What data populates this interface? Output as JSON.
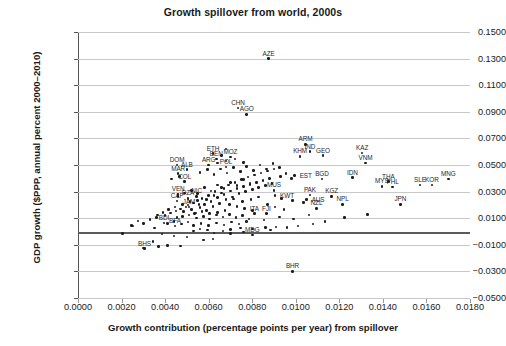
{
  "chart_data": {
    "type": "scatter",
    "title": "Growth spillover from world, 2000s",
    "xlabel": "Growth contribution (percentage points per year) from spillover",
    "ylabel": "GDP growth ($PPP, annual percent 2000–2010)",
    "xlim": [
      0.0,
      0.018
    ],
    "ylim": [
      -0.05,
      0.15
    ],
    "xticks": [
      "0.0000",
      "0.0020",
      "0.0040",
      "0.0060",
      "0.0080",
      "0.0100",
      "0.0120",
      "0.0140",
      "0.0160",
      "0.0180"
    ],
    "xtick_values": [
      0.0,
      0.002,
      0.004,
      0.006,
      0.008,
      0.01,
      0.012,
      0.014,
      0.016,
      0.018
    ],
    "yticks": [
      "0.1500",
      "0.1300",
      "0.1100",
      "0.0900",
      "0.0700",
      "0.0500",
      "0.0300",
      "0.0100",
      "−0.0100",
      "−0.0300",
      "−0.0500"
    ],
    "ytick_values": [
      0.15,
      0.13,
      0.11,
      0.09,
      0.07,
      0.05,
      0.03,
      0.01,
      -0.01,
      -0.03,
      -0.05
    ],
    "grid": "horizontal",
    "zero_line": 0.0,
    "legend": "none",
    "marker_color": "#1c1c1c",
    "grid_color": "#c9c9c9",
    "zero_line_color": "#5b5b5b",
    "points": [
      {
        "label": "AZE",
        "x": 0.00875,
        "y": 0.13,
        "lp": "above"
      },
      {
        "label": "CHN",
        "x": 0.00735,
        "y": 0.093,
        "lp": "above"
      },
      {
        "label": "AGO",
        "x": 0.00775,
        "y": 0.088,
        "lp": "above"
      },
      {
        "label": "ARM",
        "x": 0.01045,
        "y": 0.0655,
        "lp": "above"
      },
      {
        "label": "IND",
        "x": 0.01065,
        "y": 0.06,
        "lp": "above"
      },
      {
        "label": "GEO",
        "x": 0.01125,
        "y": 0.057,
        "lp": "above"
      },
      {
        "label": "KHM",
        "x": 0.0102,
        "y": 0.0565,
        "lp": "above"
      },
      {
        "label": "KAZ",
        "x": 0.01305,
        "y": 0.059,
        "lp": "above"
      },
      {
        "label": "VNM",
        "x": 0.0132,
        "y": 0.0515,
        "lp": "above"
      },
      {
        "label": "ETH",
        "x": 0.0062,
        "y": 0.0585,
        "lp": "above"
      },
      {
        "label": "MOZ",
        "x": 0.007,
        "y": 0.056,
        "lp": "above"
      },
      {
        "label": "BEN",
        "x": 0.00635,
        "y": 0.0545,
        "lp": "above"
      },
      {
        "label": "DOM",
        "x": 0.00455,
        "y": 0.05,
        "lp": "above"
      },
      {
        "label": "ALB",
        "x": 0.005,
        "y": 0.0465,
        "lp": "above"
      },
      {
        "label": "ARG",
        "x": 0.006,
        "y": 0.05,
        "lp": "above"
      },
      {
        "label": "POL",
        "x": 0.0068,
        "y": 0.0485,
        "lp": "above"
      },
      {
        "label": "EST",
        "x": 0.00995,
        "y": 0.042,
        "lp": "right"
      },
      {
        "label": "BGD",
        "x": 0.0112,
        "y": 0.0395,
        "lp": "above"
      },
      {
        "label": "IDN",
        "x": 0.0126,
        "y": 0.0405,
        "lp": "above"
      },
      {
        "label": "MAR",
        "x": 0.0046,
        "y": 0.0435,
        "lp": "above"
      },
      {
        "label": "MYS",
        "x": 0.01395,
        "y": 0.034,
        "lp": "above"
      },
      {
        "label": "THA",
        "x": 0.01425,
        "y": 0.0375,
        "lp": "above"
      },
      {
        "label": "PHL",
        "x": 0.01445,
        "y": 0.0335,
        "lp": "above"
      },
      {
        "label": "SLE",
        "x": 0.0157,
        "y": 0.035,
        "lp": "above"
      },
      {
        "label": "KOR",
        "x": 0.01625,
        "y": 0.035,
        "lp": "above"
      },
      {
        "label": "MNG",
        "x": 0.017,
        "y": 0.0395,
        "lp": "above"
      },
      {
        "label": "MUS",
        "x": 0.009,
        "y": 0.031,
        "lp": "above"
      },
      {
        "label": "COL",
        "x": 0.0049,
        "y": 0.0375,
        "lp": "above"
      },
      {
        "label": "PAK",
        "x": 0.01065,
        "y": 0.0275,
        "lp": "above"
      },
      {
        "label": "KWT",
        "x": 0.00905,
        "y": 0.027,
        "lp": "right"
      },
      {
        "label": "KGZ",
        "x": 0.01165,
        "y": 0.0265,
        "lp": "above"
      },
      {
        "label": "AUS",
        "x": 0.0105,
        "y": 0.024,
        "lp": "right"
      },
      {
        "label": "NPL",
        "x": 0.01215,
        "y": 0.0205,
        "lp": "above"
      },
      {
        "label": "NZL",
        "x": 0.01095,
        "y": 0.0175,
        "lp": "above"
      },
      {
        "label": "JPN",
        "x": 0.0148,
        "y": 0.0205,
        "lp": "above"
      },
      {
        "label": "VEN",
        "x": 0.0046,
        "y": 0.028,
        "lp": "above"
      },
      {
        "label": "NIC",
        "x": 0.00545,
        "y": 0.0265,
        "lp": "above"
      },
      {
        "label": "DZA",
        "x": 0.00505,
        "y": 0.025,
        "lp": "above"
      },
      {
        "label": "CAF",
        "x": 0.00455,
        "y": 0.023,
        "lp": "above"
      },
      {
        "label": "JAM",
        "x": 0.0051,
        "y": 0.0185,
        "lp": "above"
      },
      {
        "label": "ITA",
        "x": 0.0081,
        "y": 0.0135,
        "lp": "above"
      },
      {
        "label": "FJI",
        "x": 0.00865,
        "y": 0.0135,
        "lp": "above"
      },
      {
        "label": "BDI",
        "x": 0.00395,
        "y": 0.0065,
        "lp": "above"
      },
      {
        "label": "BFA",
        "x": 0.00445,
        "y": 0.004,
        "lp": "above"
      },
      {
        "label": "MDG",
        "x": 0.008,
        "y": -0.0025,
        "lp": "above"
      },
      {
        "label": "BHS",
        "x": 0.00305,
        "y": -0.013,
        "lp": "above"
      },
      {
        "label": "BHR",
        "x": 0.00985,
        "y": -0.03,
        "lp": "above"
      }
    ],
    "background_points": [
      {
        "x": 0.00302,
        "y": -0.0125
      },
      {
        "x": 0.00252,
        "y": 0.004
      },
      {
        "x": 0.0041,
        "y": -0.0105
      },
      {
        "x": 0.0047,
        "y": -0.011
      },
      {
        "x": 0.00385,
        "y": -0.002
      },
      {
        "x": 0.0044,
        "y": -0.0035
      },
      {
        "x": 0.005,
        "y": -0.004
      },
      {
        "x": 0.0053,
        "y": 0.0005
      },
      {
        "x": 0.0056,
        "y": 0.002
      },
      {
        "x": 0.00595,
        "y": 0.001
      },
      {
        "x": 0.00625,
        "y": -0.001
      },
      {
        "x": 0.00665,
        "y": 0.0005
      },
      {
        "x": 0.007,
        "y": 0.0015
      },
      {
        "x": 0.00745,
        "y": 0.0025
      },
      {
        "x": 0.008,
        "y": 0.002
      },
      {
        "x": 0.0086,
        "y": 0.003
      },
      {
        "x": 0.0091,
        "y": 0.0035
      },
      {
        "x": 0.0096,
        "y": 0.003
      },
      {
        "x": 0.0101,
        "y": 0.004
      },
      {
        "x": 0.00245,
        "y": 0.0045
      },
      {
        "x": 0.0033,
        "y": 0.009
      },
      {
        "x": 0.0036,
        "y": 0.0105
      },
      {
        "x": 0.004,
        "y": 0.012
      },
      {
        "x": 0.00425,
        "y": 0.014
      },
      {
        "x": 0.0045,
        "y": 0.0155
      },
      {
        "x": 0.0047,
        "y": 0.017
      },
      {
        "x": 0.00485,
        "y": 0.015
      },
      {
        "x": 0.00495,
        "y": 0.0185
      },
      {
        "x": 0.00505,
        "y": 0.02
      },
      {
        "x": 0.0052,
        "y": 0.0165
      },
      {
        "x": 0.0053,
        "y": 0.0215
      },
      {
        "x": 0.0054,
        "y": 0.014
      },
      {
        "x": 0.0055,
        "y": 0.0235
      },
      {
        "x": 0.0056,
        "y": 0.018
      },
      {
        "x": 0.0057,
        "y": 0.025
      },
      {
        "x": 0.0058,
        "y": 0.0205
      },
      {
        "x": 0.0059,
        "y": 0.016
      },
      {
        "x": 0.006,
        "y": 0.027
      },
      {
        "x": 0.0061,
        "y": 0.0225
      },
      {
        "x": 0.0062,
        "y": 0.019
      },
      {
        "x": 0.0063,
        "y": 0.03
      },
      {
        "x": 0.0064,
        "y": 0.0255
      },
      {
        "x": 0.0065,
        "y": 0.021
      },
      {
        "x": 0.0066,
        "y": 0.033
      },
      {
        "x": 0.0067,
        "y": 0.028
      },
      {
        "x": 0.0068,
        "y": 0.024
      },
      {
        "x": 0.0069,
        "y": 0.035
      },
      {
        "x": 0.007,
        "y": 0.0305
      },
      {
        "x": 0.0071,
        "y": 0.026
      },
      {
        "x": 0.0072,
        "y": 0.037
      },
      {
        "x": 0.0073,
        "y": 0.0325
      },
      {
        "x": 0.0074,
        "y": 0.0285
      },
      {
        "x": 0.0075,
        "y": 0.039
      },
      {
        "x": 0.0076,
        "y": 0.034
      },
      {
        "x": 0.0077,
        "y": 0.03
      },
      {
        "x": 0.0078,
        "y": 0.041
      },
      {
        "x": 0.0079,
        "y": 0.0355
      },
      {
        "x": 0.008,
        "y": 0.0315
      },
      {
        "x": 0.0081,
        "y": 0.0425
      },
      {
        "x": 0.0082,
        "y": 0.037
      },
      {
        "x": 0.0083,
        "y": 0.033
      },
      {
        "x": 0.0084,
        "y": 0.044
      },
      {
        "x": 0.0085,
        "y": 0.0385
      },
      {
        "x": 0.0086,
        "y": 0.0345
      },
      {
        "x": 0.0087,
        "y": 0.0455
      },
      {
        "x": 0.0088,
        "y": 0.04
      },
      {
        "x": 0.0089,
        "y": 0.036
      },
      {
        "x": 0.009,
        "y": 0.047
      },
      {
        "x": 0.00455,
        "y": 0.0105
      },
      {
        "x": 0.0048,
        "y": 0.0115
      },
      {
        "x": 0.0051,
        "y": 0.0125
      },
      {
        "x": 0.00545,
        "y": 0.01
      },
      {
        "x": 0.00575,
        "y": 0.0115
      },
      {
        "x": 0.00605,
        "y": 0.0095
      },
      {
        "x": 0.00635,
        "y": 0.0125
      },
      {
        "x": 0.00665,
        "y": 0.011
      },
      {
        "x": 0.00695,
        "y": 0.013
      },
      {
        "x": 0.00725,
        "y": 0.0105
      },
      {
        "x": 0.00755,
        "y": 0.012
      },
      {
        "x": 0.00785,
        "y": 0.0095
      },
      {
        "x": 0.0046,
        "y": 0.0265
      },
      {
        "x": 0.0049,
        "y": 0.029
      },
      {
        "x": 0.0052,
        "y": 0.031
      },
      {
        "x": 0.0055,
        "y": 0.0285
      },
      {
        "x": 0.0058,
        "y": 0.033
      },
      {
        "x": 0.0061,
        "y": 0.0305
      },
      {
        "x": 0.0064,
        "y": 0.035
      },
      {
        "x": 0.0067,
        "y": 0.0325
      },
      {
        "x": 0.007,
        "y": 0.037
      },
      {
        "x": 0.0073,
        "y": 0.0345
      },
      {
        "x": 0.0076,
        "y": 0.039
      },
      {
        "x": 0.0079,
        "y": 0.0365
      },
      {
        "x": 0.0043,
        "y": 0.0395
      },
      {
        "x": 0.00465,
        "y": 0.0415
      },
      {
        "x": 0.0056,
        "y": 0.0445
      },
      {
        "x": 0.00595,
        "y": 0.0465
      },
      {
        "x": 0.00625,
        "y": 0.043
      },
      {
        "x": 0.00655,
        "y": 0.047
      },
      {
        "x": 0.00685,
        "y": 0.044
      },
      {
        "x": 0.00715,
        "y": 0.048
      },
      {
        "x": 0.00745,
        "y": 0.045
      },
      {
        "x": 0.00775,
        "y": 0.049
      },
      {
        "x": 0.00805,
        "y": 0.046
      },
      {
        "x": 0.00835,
        "y": 0.05
      },
      {
        "x": 0.00865,
        "y": 0.047
      },
      {
        "x": 0.00895,
        "y": 0.051
      },
      {
        "x": 0.00925,
        "y": 0.048
      },
      {
        "x": 0.00955,
        "y": 0.0435
      },
      {
        "x": 0.0064,
        "y": 0.0515
      },
      {
        "x": 0.0068,
        "y": 0.053
      },
      {
        "x": 0.0072,
        "y": 0.0545
      },
      {
        "x": 0.0076,
        "y": 0.052
      },
      {
        "x": 0.0093,
        "y": 0.0415
      },
      {
        "x": 0.0098,
        "y": 0.04
      },
      {
        "x": 0.00935,
        "y": 0.025
      },
      {
        "x": 0.00985,
        "y": 0.0235
      },
      {
        "x": 0.01035,
        "y": 0.022
      },
      {
        "x": 0.0087,
        "y": 0.0205
      },
      {
        "x": 0.00905,
        "y": 0.0185
      },
      {
        "x": 0.00945,
        "y": 0.0165
      },
      {
        "x": 0.0083,
        "y": 0.026
      },
      {
        "x": 0.00795,
        "y": 0.024
      },
      {
        "x": 0.00755,
        "y": 0.0225
      },
      {
        "x": 0.00715,
        "y": 0.0245
      },
      {
        "x": 0.00675,
        "y": 0.016
      },
      {
        "x": 0.0064,
        "y": 0.0145
      },
      {
        "x": 0.00605,
        "y": 0.0135
      },
      {
        "x": 0.0057,
        "y": 0.015
      },
      {
        "x": 0.00535,
        "y": 0.0135
      },
      {
        "x": 0.0035,
        "y": 0.0025
      },
      {
        "x": 0.003,
        "y": 0.006
      },
      {
        "x": 0.00275,
        "y": 0.008
      },
      {
        "x": 0.00205,
        "y": -0.0015
      },
      {
        "x": 0.00575,
        "y": -0.0065
      },
      {
        "x": 0.0062,
        "y": -0.0055
      },
      {
        "x": 0.007,
        "y": -0.0015
      },
      {
        "x": 0.0076,
        "y": -0.0005
      },
      {
        "x": 0.00885,
        "y": 0.001
      },
      {
        "x": 0.0108,
        "y": 0.0055
      },
      {
        "x": 0.01135,
        "y": 0.0075
      },
      {
        "x": 0.01225,
        "y": 0.0105
      },
      {
        "x": 0.0133,
        "y": 0.013
      },
      {
        "x": 0.0037,
        "y": -0.0115
      },
      {
        "x": 0.00345,
        "y": -0.0075
      },
      {
        "x": 0.0106,
        "y": 0.0125
      },
      {
        "x": 0.0099,
        "y": 0.0095
      },
      {
        "x": 0.00925,
        "y": 0.011
      },
      {
        "x": 0.00855,
        "y": 0.0085
      },
      {
        "x": 0.00505,
        "y": 0.007
      },
      {
        "x": 0.00475,
        "y": 0.0055
      },
      {
        "x": 0.0044,
        "y": 0.0075
      },
      {
        "x": 0.0041,
        "y": 0.006
      },
      {
        "x": 0.0053,
        "y": 0.0045
      },
      {
        "x": 0.00565,
        "y": 0.006
      },
      {
        "x": 0.006,
        "y": 0.0045
      },
      {
        "x": 0.00635,
        "y": 0.0065
      },
      {
        "x": 0.0067,
        "y": 0.005
      },
      {
        "x": 0.00705,
        "y": 0.007
      },
      {
        "x": 0.0074,
        "y": 0.0055
      },
      {
        "x": 0.00775,
        "y": 0.0075
      },
      {
        "x": 0.0048,
        "y": 0.0205
      },
      {
        "x": 0.00515,
        "y": 0.0225
      },
      {
        "x": 0.00555,
        "y": 0.0205
      },
      {
        "x": 0.0059,
        "y": 0.024
      },
      {
        "x": 0.00625,
        "y": 0.027
      },
      {
        "x": 0.0066,
        "y": 0.029
      },
      {
        "x": 0.00695,
        "y": 0.0205
      },
      {
        "x": 0.0073,
        "y": 0.019
      },
      {
        "x": 0.00765,
        "y": 0.0175
      },
      {
        "x": 0.008,
        "y": 0.016
      },
      {
        "x": 0.00445,
        "y": 0.0185
      },
      {
        "x": 0.00415,
        "y": 0.0165
      },
      {
        "x": 0.0039,
        "y": 0.0145
      },
      {
        "x": 0.00365,
        "y": 0.0125
      },
      {
        "x": 0.0068,
        "y": 0.062
      },
      {
        "x": 0.0066,
        "y": 0.057
      }
    ]
  }
}
